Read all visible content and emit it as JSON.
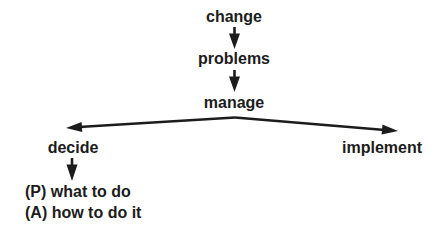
{
  "diagram_title": "change-problems-manage flow diagram",
  "colors": {
    "ink": "#1c1c1c",
    "background": "#ffffff"
  },
  "nodes": {
    "change": {
      "label": "change"
    },
    "problems": {
      "label": "problems"
    },
    "manage": {
      "label": "manage"
    },
    "decide": {
      "label": "decide"
    },
    "implement": {
      "label": "implement"
    }
  },
  "notes": {
    "p_line": "(P) what to do",
    "a_line": "(A) how to do it"
  },
  "arrows": [
    {
      "from": "change",
      "to": "problems",
      "direction": "down"
    },
    {
      "from": "problems",
      "to": "manage",
      "direction": "down"
    },
    {
      "from": "manage",
      "to": "decide",
      "direction": "down-left"
    },
    {
      "from": "manage",
      "to": "implement",
      "direction": "down-right"
    },
    {
      "from": "decide",
      "to": "p_line",
      "direction": "down"
    }
  ]
}
